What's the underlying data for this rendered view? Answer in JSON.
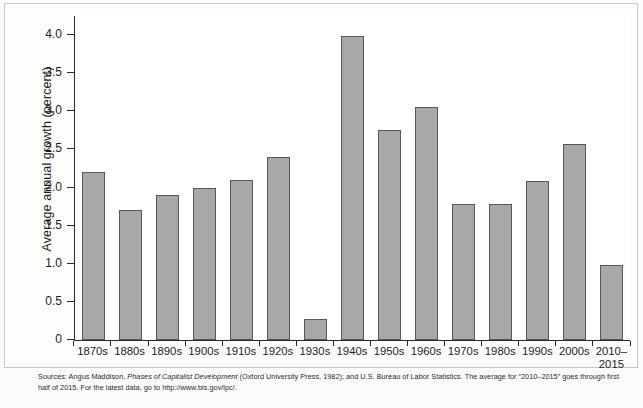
{
  "chart_data": {
    "type": "bar",
    "title": "",
    "xlabel": "",
    "ylabel": "Average annual growth (percent)",
    "categories": [
      "1870s",
      "1880s",
      "1890s",
      "1900s",
      "1910s",
      "1920s",
      "1930s",
      "1940s",
      "1950s",
      "1960s",
      "1970s",
      "1980s",
      "1990s",
      "2000s",
      "2010–\n2015"
    ],
    "values": [
      2.2,
      1.7,
      1.9,
      2.0,
      2.1,
      2.4,
      0.28,
      3.99,
      2.75,
      3.06,
      1.79,
      1.78,
      2.09,
      2.57,
      0.98
    ],
    "ylim": [
      0,
      4.25
    ],
    "yticks": [
      0,
      0.5,
      1.0,
      1.5,
      2.0,
      2.5,
      3.0,
      3.5,
      4.0
    ],
    "ytick_labels": [
      "0",
      "0.5",
      "1.0",
      "1.5",
      "2.0",
      "2.5",
      "3.0",
      "3.5",
      "4.0"
    ],
    "grid": false,
    "legend": "none",
    "bar_color": "#a8a8a8",
    "bar_edge_color": "#58585a"
  },
  "source_note": {
    "part1": "Sources: Angus Maddison, ",
    "italic": "Phases of Capitalist Development",
    "part2": " (Oxford University Press, 1982); and U.S. Bureau of Labor Statistics. The average for “2010–2015” goes through first half of 2015. For the latest data, go to http://www.bls.gov/lpc/."
  }
}
